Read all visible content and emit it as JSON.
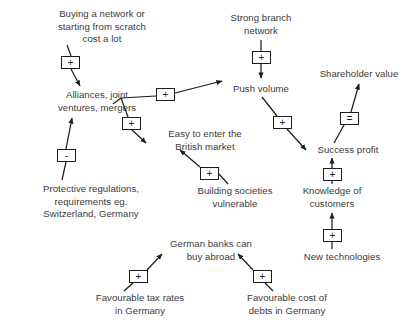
{
  "diagram": {
    "type": "causal-loop-diagram",
    "title": "",
    "background_color": "#ffffff",
    "text_color": "#3b3b3b",
    "line_color": "#1d1d1d",
    "nodes": [
      {
        "id": "buying",
        "label": "Buying a network or\nstarting from scratch\ncost a lot",
        "x": 28,
        "y": 8,
        "w": 148
      },
      {
        "id": "alliances",
        "label": "Alliances, joint\nventures, mergers",
        "x": 37,
        "y": 89,
        "w": 120
      },
      {
        "id": "protective",
        "label": "Protective regulations,\nrequirements eg.\nSwitzerland, Germany",
        "x": 14,
        "y": 183,
        "w": 154
      },
      {
        "id": "easy",
        "label": "Easy to enter the\nBritish market",
        "x": 150,
        "y": 128,
        "w": 110
      },
      {
        "id": "building",
        "label": "Building societies\nvulnerable",
        "x": 182,
        "y": 185,
        "w": 106
      },
      {
        "id": "strong",
        "label": "Strong branch\nnetwork",
        "x": 228,
        "y": 12,
        "w": 96
      },
      {
        "id": "push",
        "label": "Push volume",
        "x": 230,
        "y": 83,
        "w": 92
      },
      {
        "id": "success",
        "label": "Success profit",
        "x": 300,
        "y": 144,
        "w": 96
      },
      {
        "id": "shareholder",
        "label": "Shareholder value",
        "x": 311,
        "y": 68,
        "w": 96
      },
      {
        "id": "knowledge",
        "label": "Knowledge of\ncustomers",
        "x": 300,
        "y": 185,
        "w": 88
      },
      {
        "id": "newtech",
        "label": "New technologies",
        "x": 286,
        "y": 251,
        "w": 112
      },
      {
        "id": "germanbanks",
        "label": "German banks can\nbuy abroad",
        "x": 155,
        "y": 238,
        "w": 112
      },
      {
        "id": "taxrates",
        "label": "Favourable tax rates\nin Germany",
        "x": 78,
        "y": 292,
        "w": 124
      },
      {
        "id": "debts",
        "label": "Favourable cost of\ndebts in Germany",
        "x": 227,
        "y": 292,
        "w": 120
      }
    ],
    "links": [
      {
        "from": "buying",
        "to": "alliances",
        "sign": "+",
        "sign_x": 61,
        "sign_y": 56
      },
      {
        "from": "protective",
        "to": "alliances",
        "sign": "-",
        "sign_x": 57,
        "sign_y": 149
      },
      {
        "from": "alliances",
        "to": "push",
        "sign": "+",
        "sign_x": 156,
        "sign_y": 90
      },
      {
        "from": "alliances",
        "to": "easy",
        "sign": "+",
        "sign_x": 125,
        "sign_y": 117
      },
      {
        "from": "building",
        "to": "easy",
        "sign": "+",
        "sign_x": 200,
        "sign_y": 167
      },
      {
        "from": "strong",
        "to": "push",
        "sign": "+",
        "sign_x": 251,
        "sign_y": 51
      },
      {
        "from": "push",
        "to": "success",
        "sign": "+",
        "sign_x": 274,
        "sign_y": 116
      },
      {
        "from": "success",
        "to": "shareholder",
        "sign": "=",
        "sign_x": 339,
        "sign_y": 112
      },
      {
        "from": "knowledge",
        "to": "success",
        "sign": "+",
        "sign_x": 322,
        "sign_y": 168
      },
      {
        "from": "newtech",
        "to": "knowledge",
        "sign": "+",
        "sign_x": 322,
        "sign_y": 229
      },
      {
        "from": "taxrates",
        "to": "germanbanks",
        "sign": "+",
        "sign_x": 128,
        "sign_y": 270
      },
      {
        "from": "debts",
        "to": "germanbanks",
        "sign": "+",
        "sign_x": 253,
        "sign_y": 270
      }
    ],
    "sign_labels": {
      "positive": "+",
      "negative": "-",
      "equals": "="
    }
  }
}
